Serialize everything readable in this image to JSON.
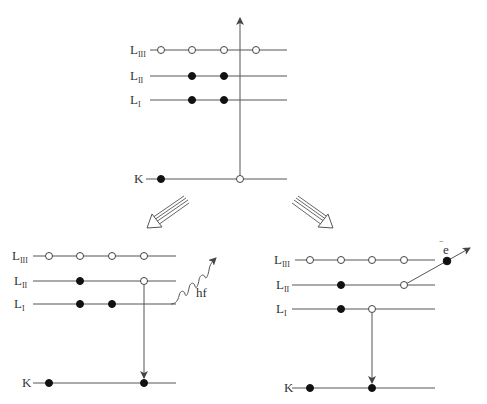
{
  "diagram": {
    "type": "atomic-shell-transitions",
    "top": {
      "name": "initial-ionization",
      "levels": [
        {
          "label": "L",
          "sub": "III",
          "y": 50,
          "x1": 150,
          "x2": 287,
          "electrons": [],
          "vacancies": [
            161,
            192,
            224,
            256
          ]
        },
        {
          "label": "L",
          "sub": "II",
          "y": 76,
          "x1": 150,
          "x2": 287,
          "electrons": [
            192,
            224
          ],
          "vacancies": []
        },
        {
          "label": "L",
          "sub": "I",
          "y": 100,
          "x1": 150,
          "x2": 287,
          "electrons": [
            192,
            224
          ],
          "vacancies": []
        },
        {
          "label": "K",
          "sub": "",
          "y": 179,
          "x1": 150,
          "x2": 287,
          "electrons": [
            161
          ],
          "vacancies": [
            240
          ]
        }
      ],
      "ejection_arrow": {
        "x": 240,
        "y1": 179,
        "y2": 17
      }
    },
    "split_arrows": [
      {
        "direction": "down-left",
        "x1": 186,
        "y1": 200,
        "x2": 148,
        "y2": 228
      },
      {
        "direction": "down-right",
        "x1": 294,
        "y1": 200,
        "x2": 333,
        "y2": 228
      }
    ],
    "left": {
      "name": "fluorescence",
      "levels": [
        {
          "label": "L",
          "sub": "III",
          "y": 256,
          "x1": 32,
          "x2": 176,
          "electrons": [],
          "vacancies": [
            49,
            80,
            112,
            144
          ]
        },
        {
          "label": "L",
          "sub": "II",
          "y": 281,
          "x1": 32,
          "x2": 176,
          "electrons": [
            80
          ],
          "vacancies": [
            144
          ]
        },
        {
          "label": "L",
          "sub": "I",
          "y": 304,
          "x1": 32,
          "x2": 176,
          "electrons": [
            80,
            112
          ],
          "vacancies": []
        },
        {
          "label": "K",
          "sub": "",
          "y": 383,
          "x1": 32,
          "x2": 176,
          "electrons": [
            49,
            144
          ],
          "vacancies": []
        }
      ],
      "transition_arrow": {
        "x": 144,
        "y1": 281,
        "y2": 379
      },
      "photon_label": "hf"
    },
    "right": {
      "name": "auger",
      "levels": [
        {
          "label": "L",
          "sub": "III",
          "y": 260,
          "x1": 295,
          "x2": 435,
          "electrons": [],
          "vacancies": [
            310,
            341,
            372,
            404
          ]
        },
        {
          "label": "L",
          "sub": "II",
          "y": 285,
          "x1": 292,
          "x2": 435,
          "electrons": [
            341
          ],
          "vacancies": [
            404
          ]
        },
        {
          "label": "L",
          "sub": "I",
          "y": 309,
          "x1": 292,
          "x2": 435,
          "electrons": [
            341
          ],
          "vacancies": [
            372
          ]
        },
        {
          "label": "K",
          "sub": "",
          "y": 388,
          "x1": 292,
          "x2": 435,
          "electrons": [
            310,
            372
          ],
          "vacancies": []
        }
      ],
      "transition_arrow": {
        "x": 372,
        "y1": 309,
        "y2": 384
      },
      "ejected_electron_label": "e",
      "ejected_electron_sign": "−"
    }
  }
}
